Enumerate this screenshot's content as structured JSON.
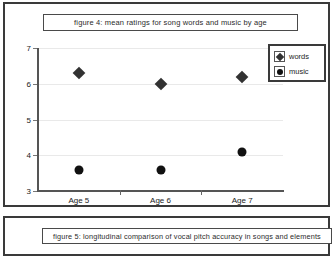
{
  "figure4": {
    "caption": "figure 4: mean ratings for song words and music by age",
    "legend": [
      {
        "label": "words",
        "marker": "diamond-marker-icon"
      },
      {
        "label": "music",
        "marker": "circle-marker-icon"
      }
    ]
  },
  "figure5": {
    "caption": "figure 5: longitudinal comparison of vocal pitch accuracy in songs and elements"
  },
  "chart_data": {
    "type": "scatter",
    "title": "figure 4: mean ratings for song words and music by age",
    "xlabel": "",
    "ylabel": "",
    "categories": [
      "Age 5",
      "Age 6",
      "Age 7"
    ],
    "ylim": [
      3,
      7
    ],
    "yticks": [
      3,
      4,
      5,
      6,
      7
    ],
    "ytick_labels": [
      "3",
      "4",
      "5",
      "6",
      "7"
    ],
    "grid": true,
    "legend_position": "top-right",
    "series": [
      {
        "name": "words",
        "marker": "diamond",
        "color": "#323232",
        "values": [
          6.3,
          6.0,
          6.2
        ]
      },
      {
        "name": "music",
        "marker": "circle",
        "color": "#111111",
        "values": [
          3.6,
          3.6,
          4.1
        ]
      }
    ]
  }
}
